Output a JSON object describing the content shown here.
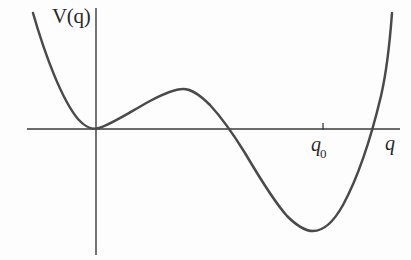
{
  "figure": {
    "background_color": "#fdfdfd",
    "curve_color": "#4a4a4a",
    "axis_color": "#3a3a3a",
    "text_color": "#2a2a2a"
  },
  "labels": {
    "ylabel": "V(q)",
    "xlabel": "q",
    "tick_q0_base": "q",
    "tick_q0_sub": "0"
  },
  "chart_data": {
    "type": "line",
    "title": "",
    "subtitle": "",
    "xlabel": "q",
    "ylabel": "V(q)",
    "grid": false,
    "legend": null,
    "axes": {
      "x_axis_y_pixel": 129,
      "y_axis_x_pixel": 96,
      "x_axis_extent_px": [
        27,
        400
      ],
      "y_axis_extent_px": [
        8,
        255
      ],
      "origin_px": [
        96,
        129
      ]
    },
    "tick_labels": {
      "x": [
        "q_0"
      ],
      "y": []
    },
    "ticks_px": [
      {
        "label": "q_0",
        "x": 323,
        "y": 129
      }
    ],
    "annotations": [
      {
        "text": "V(q)",
        "x": 52,
        "y": 6,
        "role": "y-axis-label"
      },
      {
        "text": "q",
        "x": 385,
        "y": 133,
        "role": "x-axis-label"
      },
      {
        "text": "q_0",
        "x": 311,
        "y": 134,
        "role": "x-tick-label"
      }
    ],
    "features": [
      {
        "name": "tangential-minimum-at-origin",
        "x_px": 96,
        "y_px": 129,
        "value": 0
      },
      {
        "name": "local-maximum",
        "x_px": 183,
        "y_px": 89
      },
      {
        "name": "zero-crossing-descending",
        "x_px": 234,
        "y_px": 129,
        "value": 0
      },
      {
        "name": "global-minimum",
        "x_px": 311,
        "y_px": 230
      },
      {
        "name": "zero-crossing-ascending",
        "x_px": 370,
        "y_px": 129,
        "value": 0
      }
    ],
    "curve_path_px": "M 33,13 C 45,55 62,100 78,119 C 86,128 92,130 99,128 C 112,124 130,112 150,101 C 165,93 175,89 183,89 C 192,89 200,95 210,105 C 222,118 232,132 245,153 C 258,175 272,199 287,216 C 297,226 305,231 313,231 C 323,231 333,223 343,205 C 356,181 370,142 381,96 C 387,70 390,40 392,13",
    "series": [
      {
        "name": "V(q)",
        "x": [
          0.0,
          0.1,
          0.2,
          0.3,
          0.4,
          0.5,
          0.6,
          0.7,
          0.8,
          0.9,
          1.0,
          1.1,
          1.2,
          1.3,
          1.4,
          1.5,
          1.6,
          1.7,
          1.8,
          1.9,
          2.0,
          2.1,
          2.2,
          2.3,
          2.4,
          2.5
        ],
        "y": [
          0.0,
          0.08,
          0.23,
          0.38,
          0.48,
          0.52,
          0.5,
          0.42,
          0.28,
          0.1,
          -0.12,
          -0.36,
          -0.6,
          -0.82,
          -1.0,
          -1.12,
          -1.17,
          -1.14,
          -1.0,
          -0.74,
          -0.34,
          0.23,
          1.0,
          2.0,
          3.26,
          4.82
        ]
      }
    ],
    "xlim": [
      -0.45,
      2.55
    ],
    "ylim": [
      -1.55,
      1.95
    ]
  }
}
